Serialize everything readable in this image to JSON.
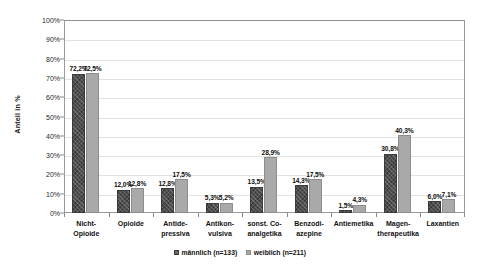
{
  "chart_data": {
    "type": "bar",
    "title": "",
    "xlabel": "",
    "ylabel": "Anteil in %",
    "ylim": [
      0,
      100
    ],
    "grid": true,
    "legend_position": "bottom",
    "categories": [
      "Nicht-Opioide",
      "Opioide",
      "Antidepressiva",
      "Antikonvulsiva",
      "sonst. Co-analgetika",
      "Benzodiazepine",
      "Antiemetika",
      "Magentherapeutika",
      "Laxantien"
    ],
    "category_lines": [
      [
        "Nicht-",
        "Opioide"
      ],
      [
        "Opioide"
      ],
      [
        "Antide-",
        "pressiva"
      ],
      [
        "Antikon-",
        "vulsiva"
      ],
      [
        "sonst. Co-",
        "analgetika"
      ],
      [
        "Benzodi-",
        "azepine"
      ],
      [
        "Antiemetika"
      ],
      [
        "Magen-",
        "therapeutika"
      ],
      [
        "Laxantien"
      ]
    ],
    "series": [
      {
        "name": "männlich (n=133)",
        "color": "#4f4f4f",
        "values": [
          72.2,
          12.0,
          12.8,
          5.3,
          13.5,
          14.3,
          1.5,
          30.8,
          6.0
        ],
        "labels": [
          "72,2%",
          "12,0%",
          "12,8%",
          "5,3%",
          "13,5%",
          "14,3%",
          "1,5%",
          "30,8%",
          "6,0%"
        ]
      },
      {
        "name": "weiblich (n=211)",
        "color": "#a9a9a9",
        "values": [
          72.5,
          12.8,
          17.5,
          5.2,
          28.9,
          17.5,
          4.3,
          40.3,
          7.1
        ],
        "labels": [
          "72,5%",
          "12,8%",
          "17,5%",
          "5,2%",
          "28,9%",
          "17,5%",
          "4,3%",
          "40,3%",
          "7,1%"
        ]
      }
    ],
    "yticks": [
      0,
      10,
      20,
      30,
      40,
      50,
      60,
      70,
      80,
      90,
      100
    ],
    "ytick_labels": [
      "0%",
      "10%",
      "20%",
      "30%",
      "40%",
      "50%",
      "60%",
      "70%",
      "80%",
      "90%",
      "100%"
    ]
  },
  "legend": {
    "male_label": "männlich (n=133)",
    "female_label": "weiblich (n=211)"
  },
  "axis": {
    "y_title": "Anteil in %"
  }
}
